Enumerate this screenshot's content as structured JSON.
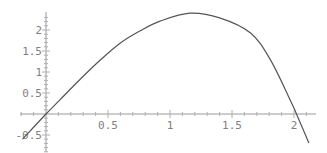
{
  "chart_data": {
    "type": "line",
    "title": "",
    "xlabel": "",
    "ylabel": "",
    "xlim": [
      -0.21,
      2.16
    ],
    "ylim": [
      -0.9,
      2.45
    ],
    "grid": false,
    "legend": null,
    "x_ticks": [
      0.5,
      1,
      1.5,
      2
    ],
    "x_tick_labels": [
      "0.5",
      "1",
      "1.5",
      "2"
    ],
    "y_ticks": [
      -0.5,
      0.5,
      1,
      1.5,
      2
    ],
    "y_tick_labels": [
      "-0.5",
      "0.5",
      "1",
      "1.5",
      "2"
    ],
    "series": [
      {
        "name": "f(x)",
        "color": "#555555",
        "x": [
          -0.19,
          0,
          0.11,
          0.27,
          0.44,
          0.6,
          0.76,
          0.92,
          1.16,
          1.4,
          1.65,
          1.81,
          1.97,
          2.02,
          2.12
        ],
        "y": [
          -0.6,
          0,
          0.33,
          0.81,
          1.29,
          1.69,
          1.98,
          2.21,
          2.4,
          2.29,
          1.93,
          1.29,
          0.33,
          0,
          -0.69
        ]
      }
    ]
  }
}
